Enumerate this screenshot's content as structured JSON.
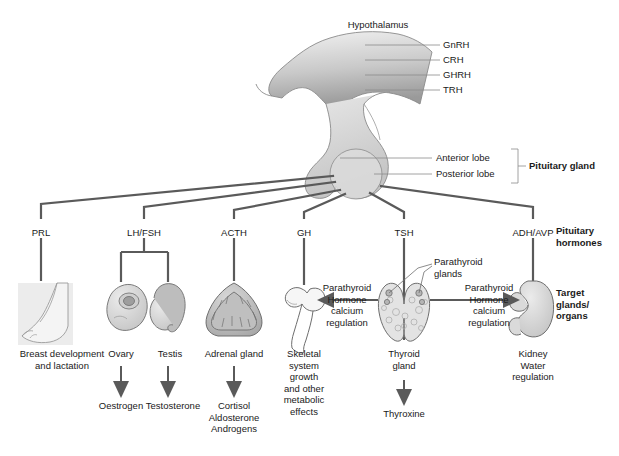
{
  "diagram": {
    "background": "#ffffff",
    "line_color": "#5a5a5a",
    "thin_line_color": "#8a8a8a",
    "organ_fill": "#d9d9d9",
    "organ_stroke": "#6e6e6e"
  },
  "hypothalamus": {
    "label": "Hypothalamus",
    "releasing_hormones": [
      {
        "label": "GnRH"
      },
      {
        "label": "CRH"
      },
      {
        "label": "GHRH"
      },
      {
        "label": "TRH"
      }
    ]
  },
  "pituitary": {
    "group_label": "Pituitary gland",
    "lobes": [
      {
        "label": "Anterior lobe"
      },
      {
        "label": "Posterior lobe"
      }
    ]
  },
  "row_labels": {
    "hormones": "Pituitary\nhormones",
    "targets": "Target\nglands/\norgans"
  },
  "hormones": [
    {
      "name": "PRL",
      "target": "Breast development\nand lactation",
      "secretion": ""
    },
    {
      "name": "LH/FSH",
      "target": "Ovary",
      "secretion": "Oestrogen"
    },
    {
      "name": "LH/FSH-2",
      "target": "Testis",
      "secretion": "Testosterone"
    },
    {
      "name": "ACTH",
      "target": "Adrenal gland",
      "secretion": "Cortisol\nAldosterone\nAndrogens"
    },
    {
      "name": "GH",
      "target": "Skeletal\nsystem\ngrowth\nand other\nmetabolic\neffects",
      "secretion": ""
    },
    {
      "name": "TSH",
      "target": "Thyroid\ngland",
      "secretion": "Thyroxine"
    },
    {
      "name": "ADH/AVP",
      "target": "Kidney\nWater\nregulation",
      "secretion": ""
    }
  ],
  "hormone_labels": [
    {
      "id": "prl",
      "text": "PRL"
    },
    {
      "id": "lhfsh",
      "text": "LH/FSH"
    },
    {
      "id": "acth",
      "text": "ACTH"
    },
    {
      "id": "gh",
      "text": "GH"
    },
    {
      "id": "tsh",
      "text": "TSH"
    },
    {
      "id": "adhavp",
      "text": "ADH/AVP"
    }
  ],
  "organ_labels": [
    {
      "id": "breast",
      "text": "Breast development\nand lactation"
    },
    {
      "id": "ovary",
      "text": "Ovary"
    },
    {
      "id": "testis",
      "text": "Testis"
    },
    {
      "id": "adrenal",
      "text": "Adrenal gland"
    },
    {
      "id": "bone",
      "text": "Skeletal\nsystem\ngrowth\nand other\nmetabolic\neffects"
    },
    {
      "id": "thyroid",
      "text": "Thyroid\ngland"
    },
    {
      "id": "kidney",
      "text": "Kidney\nWater\nregulation"
    }
  ],
  "secretion_labels": [
    {
      "id": "oestrogen",
      "text": "Oestrogen"
    },
    {
      "id": "testosterone",
      "text": "Testosterone"
    },
    {
      "id": "adrenal-out",
      "text": "Cortisol\nAldosterone\nAndrogens"
    },
    {
      "id": "thyroxine",
      "text": "Thyroxine"
    }
  ],
  "parathyroid": {
    "callout": "Parathyroid\nglands",
    "left_arrow": "Parathyroid\nHormone\ncalcium\nregulation",
    "right_arrow": "Parathyroid\nHormone\ncalcium\nregulation"
  }
}
